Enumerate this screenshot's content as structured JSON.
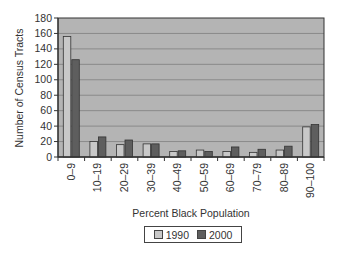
{
  "chart_data": {
    "type": "bar",
    "title": "",
    "xlabel": "Percent Black Population",
    "ylabel": "Number of Census Tracts",
    "ylim": [
      0,
      180
    ],
    "yticks": [
      0,
      20,
      40,
      60,
      80,
      100,
      120,
      140,
      160,
      180
    ],
    "grid": true,
    "legend_position": "bottom",
    "categories": [
      "0–9",
      "10–19",
      "20–29",
      "30–39",
      "40–49",
      "50–59",
      "60–69",
      "70–79",
      "80–89",
      "90–100"
    ],
    "series": [
      {
        "name": "1990",
        "color": "#c8c8c8",
        "values": [
          156,
          20,
          16,
          17,
          7,
          9,
          7,
          6,
          9,
          39
        ]
      },
      {
        "name": "2000",
        "color": "#5e5e5e",
        "values": [
          126,
          26,
          22,
          17,
          8,
          7,
          13,
          10,
          14,
          42
        ]
      }
    ]
  },
  "colors": {
    "plot_background": "#b4b4b4",
    "gridline": "#8a8a8a",
    "axis": "#333333"
  }
}
